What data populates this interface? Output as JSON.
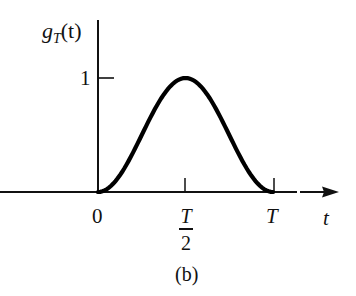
{
  "figure": {
    "y_label": "g",
    "y_label_sub": "T",
    "y_label_arg": "(t)",
    "y_tick": "1",
    "x_ticks": {
      "zero": "0",
      "half_num": "T",
      "half_den": "2",
      "full": "T"
    },
    "x_label": "t",
    "caption": "(b)"
  },
  "chart_data": {
    "type": "line",
    "title": "",
    "caption": "(b)",
    "ylabel": "g_T(t)",
    "xlabel": "t",
    "x_tick_labels": [
      "0",
      "T/2",
      "T"
    ],
    "y_tick_labels": [
      "1"
    ],
    "x": [
      0,
      0.125,
      0.25,
      0.375,
      0.5,
      0.625,
      0.75,
      0.875,
      1.0
    ],
    "x_units": "fraction of T",
    "series": [
      {
        "name": "g_T(t) = (1 - cos(2πt/T))/2",
        "values": [
          0,
          0.146,
          0.5,
          0.854,
          1.0,
          0.854,
          0.5,
          0.146,
          0
        ]
      }
    ],
    "ylim": [
      0,
      1
    ],
    "grid": false,
    "legend": "none"
  }
}
